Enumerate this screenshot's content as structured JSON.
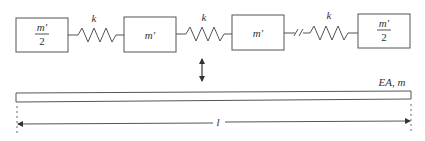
{
  "diagram": {
    "masses": [
      {
        "label_num": "m′",
        "label_den": "2",
        "fraction": true
      },
      {
        "label": "m′",
        "fraction": false
      },
      {
        "label": "m′",
        "fraction": false
      },
      {
        "label_num": "m′",
        "label_den": "2",
        "fraction": true
      }
    ],
    "springs": [
      {
        "label": "k",
        "broken": false
      },
      {
        "label": "k",
        "broken": false
      },
      {
        "label": "k",
        "broken": true
      }
    ],
    "coupling_arrow": "double-arrow-vertical",
    "bar": {
      "label": "EA, m"
    },
    "dimension": {
      "label": "l"
    },
    "colors": {
      "stroke": "#555555",
      "text": "#333333",
      "background": "#ffffff"
    }
  }
}
